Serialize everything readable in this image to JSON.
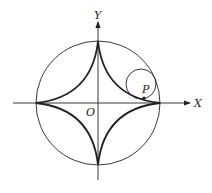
{
  "diagram": {
    "labels": {
      "y_axis": "Y",
      "x_axis": "X",
      "origin": "O",
      "point": "P"
    },
    "colors": {
      "stroke": "#222222",
      "background": "#ffffff"
    },
    "geometry": {
      "center": [
        98,
        103
      ],
      "outer_circle_radius": 62,
      "rolling_circle_center": [
        141,
        84
      ],
      "rolling_circle_radius": 15
    }
  }
}
